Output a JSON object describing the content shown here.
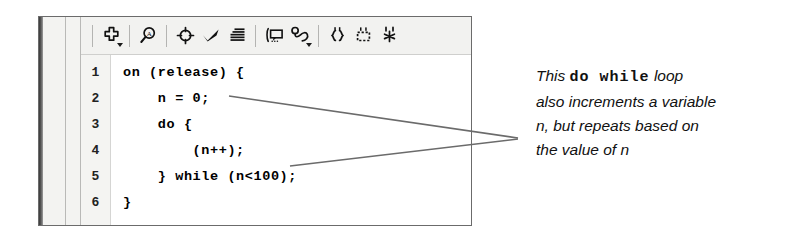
{
  "panel": {
    "name": "actions-panel",
    "toolbar": {
      "buttons": [
        {
          "id": "add-statement",
          "icon": "plus-cross-icon",
          "label": "Add a new item to the script",
          "has_caret": true
        },
        {
          "id": "find",
          "icon": "find-magnifier-icon",
          "label": "Find",
          "has_caret": false
        },
        {
          "id": "insert-target",
          "icon": "target-crosshair-icon",
          "label": "Insert a target path",
          "has_caret": false
        },
        {
          "id": "check-syntax",
          "icon": "checkmark-icon",
          "label": "Check syntax",
          "has_caret": false
        },
        {
          "id": "auto-format",
          "icon": "auto-format-lines-icon",
          "label": "Auto format",
          "has_caret": false
        },
        {
          "id": "show-code-hint",
          "icon": "code-hint-balloon-icon",
          "label": "Show code hint",
          "has_caret": false
        },
        {
          "id": "debug-options",
          "icon": "debug-loop-icon",
          "label": "Debug options",
          "has_caret": true
        },
        {
          "id": "insert-braces",
          "icon": "curly-braces-icon",
          "label": "Insert braces",
          "has_caret": false
        },
        {
          "id": "collapse-block",
          "icon": "collapse-block-icon",
          "label": "Collapse block",
          "has_caret": false
        },
        {
          "id": "expand-all",
          "icon": "expand-all-icon",
          "label": "Expand all",
          "has_caret": false
        }
      ],
      "separators_after": [
        0,
        1,
        4,
        6
      ]
    },
    "editor": {
      "line_numbers": [
        "1",
        "2",
        "3",
        "4",
        "5",
        "6"
      ],
      "lines": [
        "on (release) {",
        "    n = 0;",
        "    do {",
        "        (n++);",
        "    } while (n<100);",
        "}"
      ]
    }
  },
  "annotation": {
    "lines": [
      {
        "segments": [
          {
            "text": "This ",
            "style": "italic"
          },
          {
            "text": "do while",
            "style": "mono"
          },
          {
            "text": " loop",
            "style": "italic"
          }
        ]
      },
      {
        "segments": [
          {
            "text": "also increments a variable",
            "style": "italic"
          }
        ]
      },
      {
        "segments": [
          {
            "text": "n, but repeats based on",
            "style": "italic"
          }
        ]
      },
      {
        "segments": [
          {
            "text": "the value of n",
            "style": "italic"
          }
        ]
      }
    ],
    "leader_lines": [
      {
        "name": "leader-to-line-2",
        "from_x": 229,
        "from_y": 96,
        "to_x": 518,
        "to_y": 138
      },
      {
        "name": "leader-to-line-4",
        "from_x": 290,
        "from_y": 166,
        "to_x": 518,
        "to_y": 139
      }
    ],
    "leader_color": "#6b6b6b"
  },
  "colors": {
    "panel_bg": "#f3f3f1",
    "editor_bg": "#ffffff",
    "gutter_bg": "#f4f4f2",
    "panel_border": "#6b6b6b",
    "code_text": "#000000",
    "annotation_text": "#111111"
  }
}
